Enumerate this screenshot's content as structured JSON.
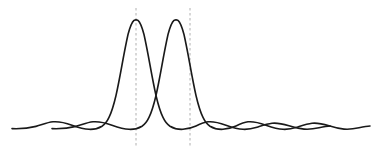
{
  "figure": {
    "width": 381,
    "height": 155,
    "background_color": "#ffffff"
  },
  "style": {
    "curve_color": "#1a1a1a",
    "curve_width": 1.6,
    "marker_color": "#b0b0b0",
    "marker_width": 1.0,
    "marker_dash": "2.5,2.5"
  },
  "chart_data": {
    "type": "line",
    "subtitle": "",
    "xlabel": "",
    "ylabel": "",
    "xlim": [
      -6.2,
      6.2
    ],
    "ylim": [
      0,
      1
    ],
    "grid": false,
    "legend": "none",
    "axis_visible": false,
    "tick_labels_x": [],
    "tick_labels_y": [],
    "annotations": [
      {
        "name": "peak-1-marker",
        "type": "vertical-dashed-line",
        "x": -0.5,
        "y_from": 0,
        "y_to": 1.08,
        "label": ""
      },
      {
        "name": "peak-2-marker",
        "type": "vertical-dashed-line",
        "x": 0.5,
        "y_from": 0,
        "y_to": 1.08,
        "label": ""
      }
    ],
    "function": "sinc-squared",
    "function_expression": "I(x) = (sin(pi*(x-x0)) / (pi*(x-x0)))^2",
    "series": [
      {
        "name": "Source 1 diffraction pattern",
        "peak_x": -0.5,
        "peak_y": 1.0,
        "first_null_offset": 1.0,
        "color": "#1a1a1a",
        "x": [
          -5.7,
          -5.4,
          -5.1,
          -4.8,
          -4.5,
          -4.2,
          -3.9,
          -3.6,
          -3.3,
          -3.0,
          -2.7,
          -2.4,
          -2.1,
          -1.8,
          -1.5,
          -1.2,
          -0.9,
          -0.6,
          -0.5,
          -0.4,
          -0.1,
          0.2,
          0.5,
          0.8,
          1.1,
          1.4,
          1.7,
          2.0,
          2.3,
          2.6,
          2.9,
          3.2,
          3.5,
          3.8,
          4.1,
          4.4,
          4.7,
          5.0,
          5.3,
          5.6
        ],
        "y": [
          0.012,
          0.022,
          0.03,
          0.032,
          0.026,
          0.015,
          0.005,
          0.001,
          0.006,
          0.016,
          0.03,
          0.042,
          0.045,
          0.036,
          0.017,
          0.002,
          0.055,
          0.36,
          1.0,
          0.89,
          0.76,
          0.3,
          0.0,
          0.017,
          0.04,
          0.045,
          0.038,
          0.024,
          0.01,
          0.002,
          0.003,
          0.012,
          0.023,
          0.03,
          0.03,
          0.024,
          0.014,
          0.005,
          0.001,
          0.005
        ]
      },
      {
        "name": "Source 2 diffraction pattern",
        "peak_x": 0.5,
        "peak_y": 1.0,
        "first_null_offset": 1.0,
        "color": "#1a1a1a",
        "x": [
          -4.7,
          -4.4,
          -4.1,
          -3.8,
          -3.5,
          -3.2,
          -2.9,
          -2.6,
          -2.3,
          -2.0,
          -1.7,
          -1.4,
          -1.1,
          -0.8,
          -0.5,
          -0.2,
          0.1,
          0.4,
          0.5,
          0.6,
          0.9,
          1.2,
          1.5,
          1.8,
          2.1,
          2.4,
          2.7,
          3.0,
          3.3,
          3.6,
          3.9,
          4.2,
          4.5,
          4.8,
          5.1,
          5.4,
          5.7,
          6.0,
          6.3,
          6.6
        ],
        "y": [
          0.012,
          0.022,
          0.03,
          0.032,
          0.026,
          0.015,
          0.005,
          0.001,
          0.006,
          0.016,
          0.03,
          0.042,
          0.045,
          0.036,
          0.0,
          0.3,
          0.76,
          0.89,
          1.0,
          0.36,
          0.055,
          0.002,
          0.017,
          0.036,
          0.045,
          0.042,
          0.03,
          0.016,
          0.006,
          0.001,
          0.005,
          0.015,
          0.026,
          0.032,
          0.03,
          0.022,
          0.012,
          0.005,
          0.002,
          0.006
        ]
      }
    ]
  },
  "geometry": {
    "baseline_y": 128,
    "peak_top_y": 20,
    "peak1_x": 136,
    "peak2_x": 190,
    "marker_top_y": 8,
    "marker_bottom_y": 146,
    "curve1_path": "M 12,128.6 C 20,128.9 28,128.4 36,126.4 C 42,124.8 47,122.4 53,121.8 C 60,121.2 66,123.0 72,125.2 C 78,127.3 83,129.0 89,129.3 C 94,129.6 98,128.6 102,126.2 C 105,124.3 107,121.6 109,117.4 C 112,111.3 114,104.0 116,95.5 C 118,86.5 120,76.0 122,65.0 C 124,54.0 126,43.5 128,34.5 C 130,27.0 132,22.0 134,20.4 C 135,19.9 137,19.9 138,20.4 C 140,22.0 142,27.0 144,34.5 C 146,43.5 148,54.0 150,65.0 C 152,76.0 154,86.5 156,95.5 C 158,104.0 160,111.3 163,117.4 C 165,121.6 167,124.3 170,126.2 C 174,128.6 178,129.6 183,129.3 C 188,129.0 192,127.8 196,126.0 C 200,124.1 204,122.3 208,121.8 C 214,121.2 220,123.0 226,125.2 C 232,127.3 237,129.0 243,129.3 C 248,129.6 252,128.8 257,127.3 C 262,125.7 267,123.9 272,123.3 C 278,122.6 283,124.0 289,125.8 C 294,127.4 299,128.7 304,129.1 C 309,129.5 314,128.9 319,127.8 C 324,126.7 327,126.1 330,126.0",
    "curve2_path": "M 52,128.6 C 60,128.9 68,128.4 76,126.4 C 82,124.8 87,122.4 93,121.8 C 100,121.2 106,123.0 112,125.2 C 118,127.3 123,129.0 129,129.3 C 134,129.6 138,128.6 142,126.2 C 145,124.3 147,121.6 149,117.4 C 152,111.3 154,104.0 156,95.5 C 158,86.5 160,76.0 162,65.0 C 164,54.0 166,43.5 168,34.5 C 170,27.0 172,22.0 174,20.4 C 175,19.9 177,19.9 178,20.4 C 180,22.0 182,27.0 184,34.5 C 186,43.5 188,54.0 190,65.0 C 192,76.0 194,86.5 196,95.5 C 198,104.0 200,111.3 203,117.4 C 205,121.6 207,124.3 210,126.2 C 214,128.6 218,129.6 223,129.3 C 228,129.0 232,127.8 236,126.0 C 240,124.1 244,122.3 248,121.8 C 254,121.2 260,123.0 266,125.2 C 272,127.3 277,129.0 283,129.3 C 288,129.6 292,128.8 297,127.3 C 302,125.7 307,123.9 312,123.3 C 318,122.6 323,124.0 329,125.8 C 334,127.4 339,128.7 344,129.1 C 349,129.5 354,128.9 359,127.8 C 364,126.7 367,126.1 370,126.0"
  }
}
